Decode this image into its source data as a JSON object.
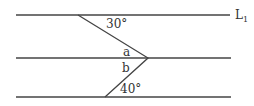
{
  "diagram": {
    "type": "parallel-lines-angle",
    "lines": [
      {
        "id": "line-top",
        "label": "L",
        "label_sub": "1",
        "y": 15,
        "x1": 16,
        "x2": 230
      },
      {
        "id": "line-middle",
        "label": "",
        "y": 58,
        "x1": 16,
        "x2": 231
      },
      {
        "id": "line-bottom",
        "label": "",
        "y": 97,
        "x1": 16,
        "x2": 231
      }
    ],
    "transversal": {
      "points": [
        [
          78,
          15
        ],
        [
          148,
          58
        ],
        [
          105,
          97
        ]
      ]
    },
    "angle_labels": {
      "top": "30°",
      "a": "a",
      "b": "b",
      "bottom": "40°"
    },
    "line_label": {
      "main": "L",
      "sub": "1"
    },
    "colors": {
      "line": "#444444",
      "text": "#333333"
    }
  }
}
